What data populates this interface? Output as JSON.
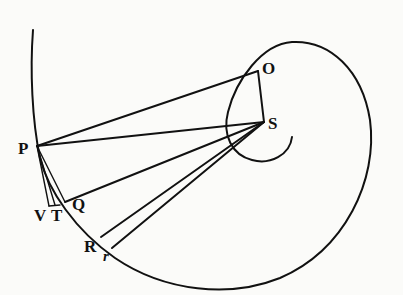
{
  "diagram": {
    "type": "geometric-figure",
    "stroke_color": "#111111",
    "background": "#fbfbf9",
    "points": {
      "O": {
        "label": "O",
        "x": 258,
        "y": 71
      },
      "S": {
        "label": "S",
        "x": 264,
        "y": 122
      },
      "P": {
        "label": "P",
        "x": 37,
        "y": 146
      },
      "V": {
        "label": "V",
        "x": 49,
        "y": 205
      },
      "T": {
        "label": "T",
        "x": 55,
        "y": 205
      },
      "Q": {
        "label": "Q",
        "x": 65,
        "y": 202
      },
      "R": {
        "label": "R",
        "x": 101,
        "y": 237
      },
      "r": {
        "label": "r",
        "x": 112,
        "y": 248
      }
    },
    "segments": [
      "P-O",
      "O-S",
      "P-S",
      "P-V",
      "P-T",
      "P-Q",
      "Q-S",
      "R-S",
      "r-S"
    ]
  }
}
